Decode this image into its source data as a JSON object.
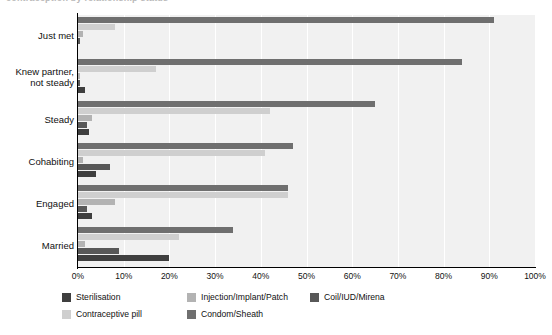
{
  "title_sliver": "contraception by relationship status",
  "chart_data": {
    "type": "bar",
    "orientation": "horizontal",
    "title": "",
    "xlabel": "",
    "ylabel": "",
    "xlim": [
      0,
      100
    ],
    "grid": true,
    "legend_position": "bottom",
    "tick_labels": [
      "0%",
      "10%",
      "20%",
      "30%",
      "40%",
      "50%",
      "60%",
      "70%",
      "80%",
      "90%",
      "100%"
    ],
    "tick_values": [
      0,
      10,
      20,
      30,
      40,
      50,
      60,
      70,
      80,
      90,
      100
    ],
    "categories": [
      "Just met",
      "Knew partner,\nnot steady",
      "Steady",
      "Cohabiting",
      "Engaged",
      "Married"
    ],
    "series": [
      {
        "name": "Sterilisation",
        "color": "#3f3f3f",
        "values": [
          0,
          1.5,
          2.5,
          4,
          3,
          20
        ]
      },
      {
        "name": "Contraceptive pill",
        "color": "#cfcfcf",
        "values": [
          8,
          17,
          42,
          41,
          46,
          22
        ]
      },
      {
        "name": "Injection/Implant/Patch",
        "color": "#b3b3b3",
        "values": [
          1,
          0.5,
          3,
          1,
          8,
          1.5
        ]
      },
      {
        "name": "Condom/Sheath",
        "color": "#6f6f6f",
        "values": [
          91,
          84,
          65,
          47,
          46,
          34
        ]
      },
      {
        "name": "Coil/IUD/Mirena",
        "color": "#585858",
        "values": [
          0.5,
          0.4,
          2,
          7,
          2,
          9
        ]
      }
    ],
    "legend_order": [
      "Sterilisation",
      "Injection/Implant/Patch",
      "Coil/IUD/Mirena",
      "Contraceptive pill",
      "Condom/Sheath"
    ],
    "series_draw_order_bottom_to_top": [
      "Sterilisation",
      "Coil/IUD/Mirena",
      "Injection/Implant/Patch",
      "Contraceptive pill",
      "Condom/Sheath"
    ]
  },
  "colors": {
    "plot_background": "#f1f1f1",
    "gridline": "#ffffff",
    "axis": "#000000",
    "text": "#111111"
  }
}
